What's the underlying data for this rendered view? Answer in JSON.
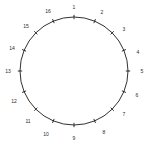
{
  "figure": {
    "kind": "circle-tick-diagram",
    "background_color": "#ffffff",
    "stroke_color": "#1a1a1a",
    "label_color": "#2b2b2b"
  },
  "chart_data": {
    "type": "scatter",
    "title": "",
    "subtitle": "",
    "xlabel": "",
    "ylabel": "",
    "grid": false,
    "legend": null,
    "geometry": {
      "center_x": 74,
      "center_y": 71,
      "radius": 54,
      "tick_count": 16,
      "start_angle_deg": 90,
      "direction": "clockwise"
    },
    "categories": [
      "1",
      "2",
      "3",
      "4",
      "5",
      "6",
      "7",
      "8",
      "9",
      "10",
      "11",
      "12",
      "13",
      "14",
      "15",
      "16"
    ],
    "points": [
      {
        "label": "1",
        "angle_deg": 90,
        "x": 74,
        "y": 17
      },
      {
        "label": "2",
        "angle_deg": 67.5,
        "x": 94.7,
        "y": 21.1
      },
      {
        "label": "3",
        "angle_deg": 45,
        "x": 112.2,
        "y": 32.8
      },
      {
        "label": "4",
        "angle_deg": 22.5,
        "x": 123.9,
        "y": 50.3
      },
      {
        "label": "5",
        "angle_deg": 0,
        "x": 128,
        "y": 71
      },
      {
        "label": "6",
        "angle_deg": 337.5,
        "x": 123.9,
        "y": 91.7
      },
      {
        "label": "7",
        "angle_deg": 315,
        "x": 112.2,
        "y": 109.2
      },
      {
        "label": "8",
        "angle_deg": 292.5,
        "x": 94.7,
        "y": 120.9
      },
      {
        "label": "9",
        "angle_deg": 270,
        "x": 74,
        "y": 125
      },
      {
        "label": "10",
        "angle_deg": 247.5,
        "x": 53.3,
        "y": 120.9
      },
      {
        "label": "11",
        "angle_deg": 225,
        "x": 35.8,
        "y": 109.2
      },
      {
        "label": "12",
        "angle_deg": 202.5,
        "x": 24.1,
        "y": 91.7
      },
      {
        "label": "13",
        "angle_deg": 180,
        "x": 20,
        "y": 71
      },
      {
        "label": "14",
        "angle_deg": 157.5,
        "x": 24.1,
        "y": 50.3
      },
      {
        "label": "15",
        "angle_deg": 135,
        "x": 35.8,
        "y": 32.8
      },
      {
        "label": "16",
        "angle_deg": 112.5,
        "x": 53.3,
        "y": 21.1
      }
    ],
    "label_offsets": [
      {
        "label": "1",
        "x": 74,
        "y": 7
      },
      {
        "label": "2",
        "x": 102,
        "y": 12
      },
      {
        "label": "3",
        "x": 124,
        "y": 29
      },
      {
        "label": "4",
        "x": 138,
        "y": 52
      },
      {
        "label": "5",
        "x": 142,
        "y": 71
      },
      {
        "label": "6",
        "x": 137,
        "y": 95
      },
      {
        "label": "7",
        "x": 124,
        "y": 114
      },
      {
        "label": "8",
        "x": 104,
        "y": 132
      },
      {
        "label": "9",
        "x": 74,
        "y": 138
      },
      {
        "label": "10",
        "x": 46,
        "y": 134
      },
      {
        "label": "11",
        "x": 28,
        "y": 121
      },
      {
        "label": "12",
        "x": 14,
        "y": 101
      },
      {
        "label": "13",
        "x": 8,
        "y": 71
      },
      {
        "label": "14",
        "x": 12,
        "y": 48
      },
      {
        "label": "15",
        "x": 26,
        "y": 26
      },
      {
        "label": "16",
        "x": 48,
        "y": 11
      }
    ]
  }
}
